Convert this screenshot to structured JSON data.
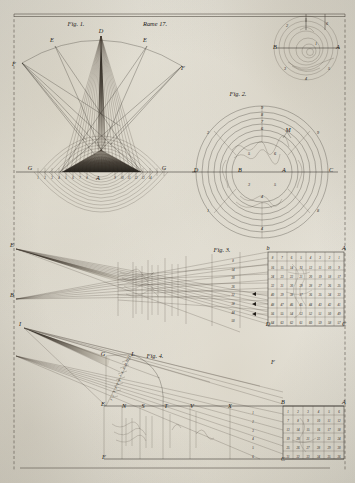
{
  "plate": {
    "header_center": "Rame 17.",
    "medium": "engraving",
    "ink_color": "#2a2520",
    "paper_color": "#e8e6df"
  },
  "figures": [
    {
      "id": "fig1",
      "caption": "Fig. 1.",
      "description": "Fan of rays from apex D through arc, crossing to baseline G-G with shaded cone and concentric wave arcs below",
      "labels": [
        {
          "text": "D",
          "x": 101,
          "y": 33,
          "kind": "apex"
        },
        {
          "text": "E",
          "x": 52,
          "y": 42,
          "kind": "arc-point"
        },
        {
          "text": "E",
          "x": 145,
          "y": 42,
          "kind": "arc-point"
        },
        {
          "text": "F",
          "x": 14,
          "y": 66,
          "kind": "outer"
        },
        {
          "text": "F",
          "x": 183,
          "y": 70,
          "kind": "outer"
        },
        {
          "text": "G",
          "x": 30,
          "y": 170,
          "kind": "baseline-end"
        },
        {
          "text": "G",
          "x": 164,
          "y": 170,
          "kind": "baseline-end"
        },
        {
          "text": "A",
          "x": 98,
          "y": 180,
          "kind": "center"
        }
      ],
      "baseline_ticks": [
        "1",
        "2",
        "3",
        "4",
        "5",
        "6",
        "7",
        "8",
        "9",
        "10",
        "11",
        "12",
        "13",
        "14"
      ]
    },
    {
      "id": "fig2",
      "caption": "Fig. 2.",
      "description": "Concentric circles with radial spokes, labelled D left and C right, centres A and B, ring numerals 1 to 9",
      "labels": [
        {
          "text": "D",
          "x": 196,
          "y": 172,
          "kind": "axis-left"
        },
        {
          "text": "C",
          "x": 331,
          "y": 172,
          "kind": "axis-right"
        },
        {
          "text": "B",
          "x": 240,
          "y": 172,
          "kind": "centre"
        },
        {
          "text": "A",
          "x": 284,
          "y": 172,
          "kind": "centre"
        },
        {
          "text": "M",
          "x": 288,
          "y": 132,
          "kind": "point"
        },
        {
          "text": "9",
          "x": 262,
          "y": 109,
          "kind": "ring"
        },
        {
          "text": "8",
          "x": 262,
          "y": 116,
          "kind": "ring"
        },
        {
          "text": "7",
          "x": 262,
          "y": 123,
          "kind": "ring"
        },
        {
          "text": "6",
          "x": 262,
          "y": 130,
          "kind": "ring"
        },
        {
          "text": "5",
          "x": 249,
          "y": 155,
          "kind": "ring"
        },
        {
          "text": "6",
          "x": 275,
          "y": 155,
          "kind": "ring"
        },
        {
          "text": "3",
          "x": 249,
          "y": 186,
          "kind": "ring"
        },
        {
          "text": "5",
          "x": 275,
          "y": 186,
          "kind": "ring"
        },
        {
          "text": "4",
          "x": 262,
          "y": 198,
          "kind": "ring"
        },
        {
          "text": "2",
          "x": 208,
          "y": 134,
          "kind": "ring-outer"
        },
        {
          "text": "9",
          "x": 318,
          "y": 134,
          "kind": "ring-outer"
        },
        {
          "text": "1",
          "x": 208,
          "y": 212,
          "kind": "ring-outer"
        },
        {
          "text": "8",
          "x": 318,
          "y": 212,
          "kind": "ring-outer"
        },
        {
          "text": "4",
          "x": 262,
          "y": 230,
          "kind": "ring-outer"
        }
      ]
    },
    {
      "id": "fig0",
      "caption": "",
      "description": "Small circular inset diagram at upper right with axis B-A and perimeter numerals",
      "labels": [
        {
          "text": "B",
          "x": 275,
          "y": 49,
          "kind": "axis-left"
        },
        {
          "text": "A",
          "x": 338,
          "y": 49,
          "kind": "axis-right"
        },
        {
          "text": "2",
          "x": 287,
          "y": 27,
          "kind": "perimeter"
        },
        {
          "text": "6",
          "x": 327,
          "y": 25,
          "kind": "perimeter"
        },
        {
          "text": "3",
          "x": 285,
          "y": 70,
          "kind": "perimeter"
        },
        {
          "text": "5",
          "x": 329,
          "y": 70,
          "kind": "perimeter"
        },
        {
          "text": "4",
          "x": 306,
          "y": 80,
          "kind": "perimeter"
        },
        {
          "text": "1",
          "x": 316,
          "y": 45,
          "kind": "perimeter"
        }
      ]
    },
    {
      "id": "fig3",
      "caption": "Fig. 3.",
      "description": "Wide perspective ray fan from E and B at left converging to a ruled numeric grid at right, bounded b-A above and D-C below",
      "labels": [
        {
          "text": "E",
          "x": 12,
          "y": 247,
          "kind": "apex-upper"
        },
        {
          "text": "B",
          "x": 12,
          "y": 297,
          "kind": "apex-lower"
        },
        {
          "text": "b",
          "x": 268,
          "y": 250,
          "kind": "grid-corner"
        },
        {
          "text": "A",
          "x": 344,
          "y": 250,
          "kind": "grid-corner"
        },
        {
          "text": "D",
          "x": 268,
          "y": 326,
          "kind": "grid-corner"
        },
        {
          "text": "C",
          "x": 344,
          "y": 326,
          "kind": "grid-corner"
        },
        {
          "text": "F",
          "x": 273,
          "y": 364,
          "kind": "vanishing"
        }
      ],
      "grid_rows": [
        [
          "8",
          "7",
          "6",
          "5",
          "4",
          "3",
          "2",
          "1"
        ],
        [
          "16",
          "15",
          "14",
          "13",
          "12",
          "11",
          "10",
          "9"
        ],
        [
          "24",
          "23",
          "22",
          "21",
          "20",
          "19",
          "18",
          "17"
        ],
        [
          "32",
          "31",
          "30",
          "29",
          "28",
          "27",
          "26",
          "25"
        ],
        [
          "40",
          "39",
          "38",
          "37",
          "36",
          "35",
          "34",
          "33"
        ],
        [
          "48",
          "47",
          "46",
          "45",
          "44",
          "43",
          "42",
          "41"
        ],
        [
          "56",
          "55",
          "54",
          "53",
          "52",
          "51",
          "50",
          "49"
        ],
        [
          "64",
          "63",
          "62",
          "61",
          "60",
          "59",
          "58",
          "57"
        ]
      ],
      "scale_column": [
        "8",
        "14",
        "20",
        "26",
        "32",
        "38",
        "44",
        "50"
      ]
    },
    {
      "id": "fig4",
      "caption": "Fig. 4.",
      "description": "Perspective construction from point I with diagonal scale G-L-E and horizon baseline, ending in a numeric grid B-A over C",
      "labels": [
        {
          "text": "I",
          "x": 20,
          "y": 326,
          "kind": "apex"
        },
        {
          "text": "G",
          "x": 103,
          "y": 356,
          "kind": "scale-top"
        },
        {
          "text": "L",
          "x": 133,
          "y": 356,
          "kind": "scale-top"
        },
        {
          "text": "E",
          "x": 103,
          "y": 406,
          "kind": "scale-foot"
        },
        {
          "text": "F",
          "x": 104,
          "y": 459,
          "kind": "base-left"
        },
        {
          "text": "B",
          "x": 283,
          "y": 404,
          "kind": "grid-corner"
        },
        {
          "text": "A",
          "x": 344,
          "y": 404,
          "kind": "grid-corner"
        },
        {
          "text": "C",
          "x": 283,
          "y": 461,
          "kind": "grid-corner"
        },
        {
          "text": "N",
          "x": 124,
          "y": 408,
          "kind": "base-tick"
        },
        {
          "text": "S",
          "x": 143,
          "y": 408,
          "kind": "base-tick"
        },
        {
          "text": "T",
          "x": 166,
          "y": 408,
          "kind": "base-tick"
        },
        {
          "text": "V",
          "x": 192,
          "y": 408,
          "kind": "base-tick"
        },
        {
          "text": "X",
          "x": 230,
          "y": 408,
          "kind": "base-tick"
        }
      ],
      "scale_numerals": [
        "1",
        "2",
        "3",
        "4",
        "5",
        "6",
        "7",
        "8",
        "9",
        "10",
        "11",
        "12"
      ],
      "grid_rows": [
        [
          "1",
          "2",
          "3",
          "4",
          "5",
          "6"
        ],
        [
          "7",
          "8",
          "9",
          "10",
          "11",
          "12"
        ],
        [
          "13",
          "14",
          "15",
          "16",
          "17",
          "18"
        ],
        [
          "19",
          "20",
          "21",
          "22",
          "23",
          "24"
        ],
        [
          "25",
          "26",
          "27",
          "28",
          "29",
          "30"
        ],
        [
          "31",
          "32",
          "33",
          "34",
          "35",
          "36"
        ]
      ],
      "depth_column": [
        "1",
        "2",
        "3",
        "4",
        "5",
        "6"
      ]
    }
  ]
}
